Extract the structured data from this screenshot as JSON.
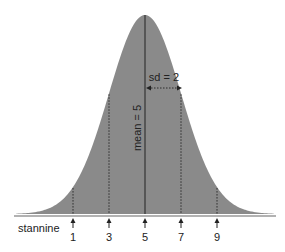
{
  "diagram": {
    "mean_label": "mean = 5",
    "sd_label": "sd = 2",
    "axis_label": "stannine",
    "ticks": [
      {
        "label": "1",
        "value": 1
      },
      {
        "label": "3",
        "value": 3
      },
      {
        "label": "5",
        "value": 5
      },
      {
        "label": "7",
        "value": 7
      },
      {
        "label": "9",
        "value": 9
      }
    ],
    "mean": 5,
    "sd": 2,
    "colors": {
      "fill": "#8a8a8a",
      "line": "#222222",
      "baseline": "#555555"
    }
  }
}
